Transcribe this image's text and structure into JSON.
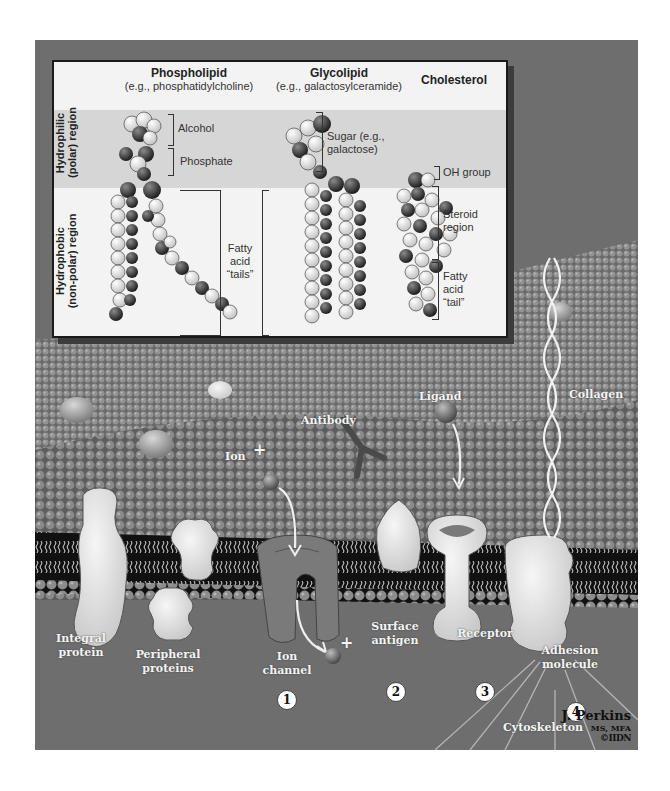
{
  "diagram": {
    "inset": {
      "columns": [
        {
          "title": "Phospholipid",
          "subtitle": "(e.g., phosphatidylcholine)"
        },
        {
          "title": "Glycolipid",
          "subtitle": "(e.g., galactosylceramide)"
        },
        {
          "title": "Cholesterol",
          "subtitle": ""
        }
      ],
      "regions": {
        "hydrophilic": {
          "line1": "Hydrophilic",
          "line2": "(polar) region"
        },
        "hydrophobic": {
          "line1": "Hydrophobic",
          "line2": "(non-polar) region"
        }
      },
      "annotations": {
        "alcohol": "Alcohol",
        "phosphate": "Phosphate",
        "fatty_acid_tails_1": "Fatty",
        "fatty_acid_tails_2": "acid",
        "fatty_acid_tails_3": "“tails”",
        "sugar_1": "Sugar (e.g.,",
        "sugar_2": "galactose)",
        "oh_group": "OH group",
        "steroid_1": "Steroid",
        "steroid_2": "region",
        "chol_tail_1": "Fatty",
        "chol_tail_2": "acid",
        "chol_tail_3": "“tail”"
      }
    },
    "membrane_labels": {
      "collagen": "Collagen",
      "ligand": "Ligand",
      "antibody": "Antibody",
      "ion": "Ion",
      "ion_charge": "+",
      "ion_charge_out": "+",
      "integral_protein_1": "Integral",
      "integral_protein_2": "protein",
      "peripheral_proteins_1": "Peripheral",
      "peripheral_proteins_2": "proteins",
      "ion_channel_1": "Ion",
      "ion_channel_2": "channel",
      "surface_antigen_1": "Surface",
      "surface_antigen_2": "antigen",
      "receptor": "Receptor",
      "adhesion_molecule_1": "Adhesion",
      "adhesion_molecule_2": "molecule",
      "cytoskeleton": "Cytoskeleton"
    },
    "numbers": [
      "1",
      "2",
      "3",
      "4"
    ],
    "credit": {
      "name": "J. Perkins",
      "degrees": "MS, MFA",
      "logo": "©IIDN"
    }
  }
}
